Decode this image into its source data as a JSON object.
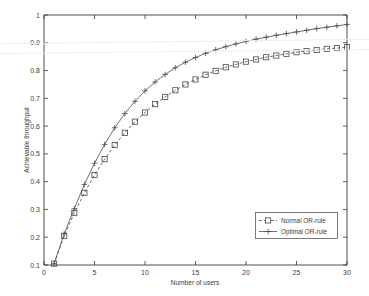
{
  "chart_data": {
    "type": "line",
    "title": "",
    "xlabel": "Number of users",
    "ylabel": "Achievable throughput",
    "xlim": [
      0,
      30
    ],
    "ylim": [
      0.1,
      1
    ],
    "grid": false,
    "legend_position": "lower right",
    "xticks": [
      0,
      5,
      10,
      15,
      20,
      25,
      30
    ],
    "xticklabels": [
      "0",
      "5",
      "10",
      "15",
      "20",
      "25",
      "30"
    ],
    "yticks": [
      0.1,
      0.2,
      0.3,
      0.4,
      0.5,
      0.6,
      0.7,
      0.8,
      0.9,
      1
    ],
    "yticklabels": [
      "0.1",
      "0.2",
      "0.3",
      "0.4",
      "0.5",
      "0.6",
      "0.7",
      "0.8",
      "0.9",
      "1"
    ],
    "x": [
      1,
      2,
      3,
      4,
      5,
      6,
      7,
      8,
      9,
      10,
      11,
      12,
      13,
      14,
      15,
      16,
      17,
      18,
      19,
      20,
      21,
      22,
      23,
      24,
      25,
      26,
      27,
      28,
      29,
      30
    ],
    "series": [
      {
        "name": "Normal OR-rule",
        "marker": "square",
        "linestyle": "dashed",
        "color": "#4a4a4a",
        "values": [
          0.105,
          0.205,
          0.287,
          0.36,
          0.424,
          0.481,
          0.532,
          0.576,
          0.616,
          0.649,
          0.679,
          0.705,
          0.729,
          0.75,
          0.768,
          0.785,
          0.799,
          0.812,
          0.822,
          0.832,
          0.84,
          0.848,
          0.854,
          0.86,
          0.866,
          0.87,
          0.874,
          0.878,
          0.881,
          0.884
        ]
      },
      {
        "name": "Optimal OR-rule",
        "marker": "plus",
        "linestyle": "solid",
        "color": "#4a4a4a",
        "values": [
          0.105,
          0.212,
          0.303,
          0.39,
          0.466,
          0.534,
          0.594,
          0.645,
          0.689,
          0.727,
          0.759,
          0.786,
          0.81,
          0.83,
          0.847,
          0.862,
          0.875,
          0.886,
          0.896,
          0.905,
          0.913,
          0.92,
          0.927,
          0.933,
          0.939,
          0.945,
          0.951,
          0.956,
          0.961,
          0.966
        ]
      }
    ],
    "legend": [
      "Normal OR-rule",
      "Optimal OR-rule"
    ]
  }
}
